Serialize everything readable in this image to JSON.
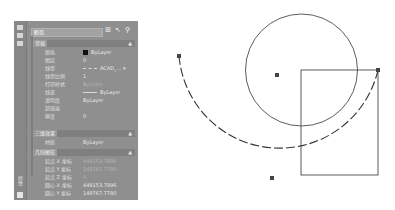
{
  "palette": {
    "strip": {
      "buttons": [
        "close-icon",
        "pin-icon",
        "menu-icon"
      ],
      "title_vertical": "特性"
    },
    "selector": {
      "value": "圆弧",
      "arrow": "▾"
    },
    "tool_icons": [
      "toggle-pickadd-icon",
      "select-objects-icon",
      "quick-select-icon"
    ],
    "sections": [
      {
        "title": "常规",
        "toggle": "▲",
        "rows": [
          {
            "key": "颜色",
            "value": "ByLayer",
            "swatch": "#111111"
          },
          {
            "key": "图层",
            "value": "0"
          },
          {
            "key": "线型",
            "value": "ACAD_...",
            "linetype": true
          },
          {
            "key": "线型比例",
            "value": "1"
          },
          {
            "key": "打印样式",
            "value": "ByColor",
            "dim": true
          },
          {
            "key": "线宽",
            "value": "ByLayer",
            "lineweight": true
          },
          {
            "key": "透明度",
            "value": "ByLayer"
          },
          {
            "key": "超链接",
            "value": ""
          },
          {
            "key": "厚度",
            "value": "0"
          }
        ]
      },
      {
        "title": "三维效果",
        "toggle": "▲",
        "rows": [
          {
            "key": "材质",
            "value": "ByLayer"
          }
        ]
      },
      {
        "title": "几何图形",
        "toggle": "▲",
        "rows": [
          {
            "key": "起点 X 坐标",
            "value": "449153.7996",
            "dim": true
          },
          {
            "key": "起点 Y 坐标",
            "value": "149767.7780",
            "dim": true
          },
          {
            "key": "起点 Z 坐标",
            "value": "0",
            "dim": true
          },
          {
            "key": "圆心 X 坐标",
            "value": "449153.7996"
          },
          {
            "key": "圆心 Y 坐标",
            "value": "149767.7780"
          }
        ]
      }
    ]
  },
  "drawing": {
    "circle": {
      "cx": 301.5,
      "cy": 70,
      "r": 56,
      "color": "#333333"
    },
    "rectangle": {
      "x": 301,
      "y": 70,
      "w": 77,
      "h": 105,
      "color": "#333333"
    },
    "arc": {
      "start": [
        179,
        56
      ],
      "end": [
        378,
        70
      ],
      "mid": [
        272,
        178
      ],
      "center": [
        277,
        75
      ],
      "radius": 101,
      "style": "dashed",
      "color": "#333333"
    },
    "grips": [
      [
        179,
        56
      ],
      [
        272,
        178
      ],
      [
        378,
        70
      ],
      [
        277,
        75
      ]
    ],
    "grip_color": "#444444"
  }
}
